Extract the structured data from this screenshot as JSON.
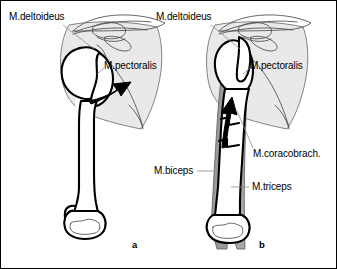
{
  "figure": {
    "border_color": "#000000",
    "background": "#ffffff"
  },
  "colors": {
    "bone_outline": "#000000",
    "scapula_fill": "#e8e8e8",
    "scapula_outline": "#555555",
    "muscle_fill": "#9a9a9a",
    "muscle_outline": "#4a4a4a",
    "arrow_fill": "#000000",
    "leader_line": "#888888",
    "text": "#000000"
  },
  "panels": [
    {
      "id": "a",
      "letter": "a",
      "letter_x": 131,
      "letter_y": 243,
      "description": "Intact shoulder: humerus articulating with glenoid, deltoid and pectoralis force vector directed laterally",
      "labels": [
        {
          "name": "m-deltoideus",
          "text": "M.deltoideus",
          "x": 8,
          "y": 10,
          "leader": {
            "x1": 62,
            "y1": 24,
            "x2": 92,
            "y2": 47
          }
        },
        {
          "name": "m-pectoralis",
          "text": "M.pectoralis",
          "x": 102,
          "y": 60,
          "leader": {
            "x1": 101,
            "y1": 66,
            "x2": 96,
            "y2": 72
          }
        }
      ],
      "arrow": {
        "name": "pectoralis-force-arrow",
        "direction": "lateral-right",
        "from_x": 88,
        "from_y": 96,
        "to_x": 124,
        "to_y": 82
      }
    },
    {
      "id": "b",
      "letter": "b",
      "letter_x": 258,
      "letter_y": 243,
      "description": "Humerus with surrounding arm muscles; biceps, triceps and coracobrachialis produce a superiorly directed force vector",
      "labels": [
        {
          "name": "m-deltoideus",
          "text": "M.deltoideus",
          "x": 155,
          "y": 10,
          "leader": {
            "x1": 210,
            "y1": 24,
            "x2": 238,
            "y2": 47
          }
        },
        {
          "name": "m-pectoralis",
          "text": "M.pectoralis",
          "x": 247,
          "y": 60,
          "leader": {
            "x1": 246,
            "y1": 66,
            "x2": 241,
            "y2": 72
          }
        },
        {
          "name": "m-coracobrachialis",
          "text": "M.coracobrach.",
          "x": 252,
          "y": 148,
          "leader": {
            "x1": 251,
            "y1": 148,
            "x2": 234,
            "y2": 112
          }
        },
        {
          "name": "m-biceps",
          "text": "M.biceps",
          "x": 153,
          "y": 165,
          "leader": {
            "x1": 196,
            "y1": 170,
            "x2": 212,
            "y2": 170
          }
        },
        {
          "name": "m-triceps",
          "text": "M.triceps",
          "x": 250,
          "y": 181,
          "leader": {
            "x1": 248,
            "y1": 186,
            "x2": 230,
            "y2": 186
          }
        }
      ],
      "arrow": {
        "name": "superior-force-arrow",
        "direction": "superior-up",
        "from_x": 227,
        "from_y": 140,
        "to_x": 232,
        "to_y": 104
      }
    }
  ]
}
